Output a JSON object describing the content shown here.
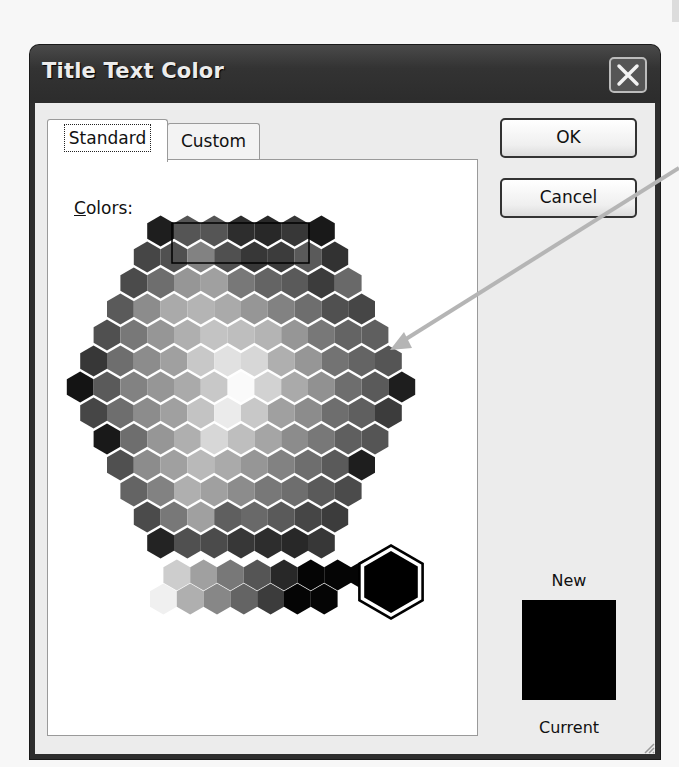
{
  "dialog": {
    "title": "Title Text Color",
    "close_icon": "close-x-icon",
    "tabs": [
      {
        "label": "Standard",
        "active": true
      },
      {
        "label": "Custom",
        "active": false
      }
    ],
    "colors_label_accel": "C",
    "colors_label_rest": "olors:",
    "buttons": {
      "ok": "OK",
      "cancel": "Cancel"
    },
    "preview": {
      "new_label": "New",
      "current_label": "Current",
      "new_color": "#000000",
      "current_color": "#000000"
    }
  },
  "honeycomb": {
    "hex_width": 26.8,
    "row_pitch": 26.0,
    "center_x": 241,
    "top_y": 231,
    "selection_box": {
      "x": 172,
      "y": 223,
      "w": 137,
      "h": 40
    },
    "rows": [
      [
        30,
        85,
        85,
        45,
        40,
        55,
        25
      ],
      [
        70,
        80,
        130,
        80,
        55,
        60,
        90,
        50
      ],
      [
        75,
        110,
        150,
        160,
        120,
        100,
        90,
        60,
        105
      ],
      [
        90,
        140,
        170,
        180,
        170,
        150,
        130,
        110,
        80,
        70
      ],
      [
        80,
        120,
        150,
        175,
        195,
        190,
        180,
        150,
        120,
        100,
        95
      ],
      [
        55,
        110,
        140,
        160,
        200,
        225,
        215,
        175,
        150,
        115,
        100,
        85
      ],
      [
        20,
        90,
        130,
        150,
        170,
        200,
        250,
        210,
        170,
        145,
        110,
        90,
        30
      ],
      [
        70,
        110,
        140,
        160,
        195,
        235,
        200,
        160,
        140,
        110,
        95,
        60
      ],
      [
        25,
        110,
        150,
        175,
        215,
        190,
        165,
        140,
        120,
        95,
        85
      ],
      [
        80,
        140,
        160,
        185,
        170,
        150,
        130,
        110,
        90,
        30
      ],
      [
        100,
        130,
        175,
        160,
        140,
        120,
        110,
        90,
        75
      ],
      [
        75,
        120,
        160,
        95,
        105,
        90,
        70,
        60
      ],
      [
        35,
        80,
        75,
        55,
        45,
        40,
        55
      ]
    ]
  },
  "grayscale_strip": {
    "big_white": 255,
    "top_row": [
      255,
      205,
      160,
      120,
      85,
      40,
      5,
      5,
      5
    ],
    "bottom_row": [
      240,
      175,
      135,
      100,
      60,
      5,
      5
    ],
    "selected": "#000000"
  },
  "annotation": {
    "arrow_color": "#b5b5b5"
  }
}
